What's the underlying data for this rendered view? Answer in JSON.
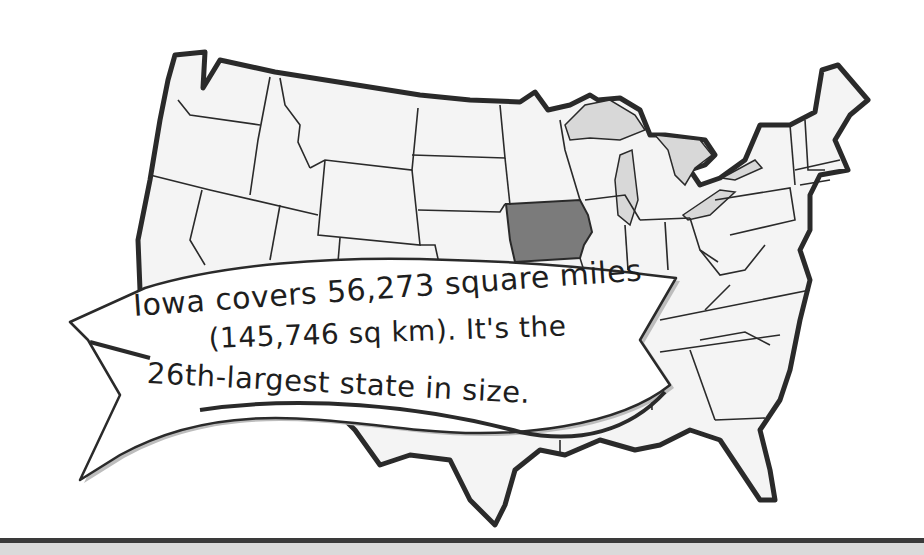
{
  "map": {
    "subject": "United States map",
    "highlighted_state": "Iowa",
    "colors": {
      "state_fill": "#f4f4f4",
      "highlight_fill": "#7b7b7b",
      "great_lakes_fill": "#d8d8d8",
      "outline": "#2a2a2a",
      "banner_fill": "#ffffff",
      "banner_shadow": "#bdbdbd"
    }
  },
  "banner": {
    "lines": [
      "Iowa covers 56,273 square miles",
      "(145,746 sq km). It's the",
      "26th-largest state in size."
    ]
  }
}
